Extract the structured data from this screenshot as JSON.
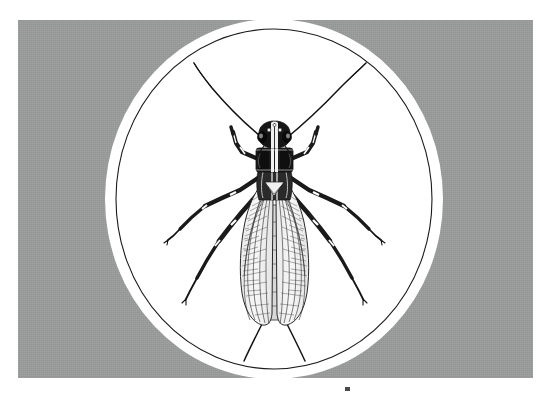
{
  "plate": {
    "subject_common_name": "stonefly",
    "subject_order": "Plecoptera",
    "view": "dorsal",
    "medium": "pen-and-ink scientific illustration",
    "vignette_shape": "oval",
    "background_label": "gray card",
    "colors": {
      "card_gray": "#999a9a",
      "vignette_white": "#ffffff",
      "ink_black": "#111111",
      "page_white": "#ffffff",
      "tick_gray": "#4a4a4a"
    },
    "geometry": {
      "card_x": 18,
      "card_y": 20,
      "card_w": 515,
      "card_h": 358,
      "oval_cx": 274,
      "oval_cy": 199,
      "oval_rx": 169,
      "oval_ry": 180,
      "oval_ring_rx": 158,
      "oval_ring_ry": 170
    }
  },
  "specimen": {
    "parts": [
      {
        "name": "antenna-left",
        "label": "left antenna"
      },
      {
        "name": "antenna-right",
        "label": "right antenna"
      },
      {
        "name": "head",
        "label": "head with compound eyes and ocelli"
      },
      {
        "name": "pronotum",
        "label": "pronotum"
      },
      {
        "name": "thorax",
        "label": "meso- and metathorax"
      },
      {
        "name": "forewing-left",
        "label": "left forewing"
      },
      {
        "name": "forewing-right",
        "label": "right forewing"
      },
      {
        "name": "abdomen",
        "label": "abdomen"
      },
      {
        "name": "cercus-left",
        "label": "left cercus"
      },
      {
        "name": "cercus-right",
        "label": "right cercus"
      },
      {
        "name": "foreleg-left",
        "label": "left foreleg"
      },
      {
        "name": "foreleg-right",
        "label": "right foreleg"
      },
      {
        "name": "midleg-left",
        "label": "left midleg"
      },
      {
        "name": "midleg-right",
        "label": "right midleg"
      },
      {
        "name": "hindleg-left",
        "label": "left hindleg"
      },
      {
        "name": "hindleg-right",
        "label": "right hindleg"
      }
    ]
  },
  "marks": {
    "bottom_tick": ""
  }
}
